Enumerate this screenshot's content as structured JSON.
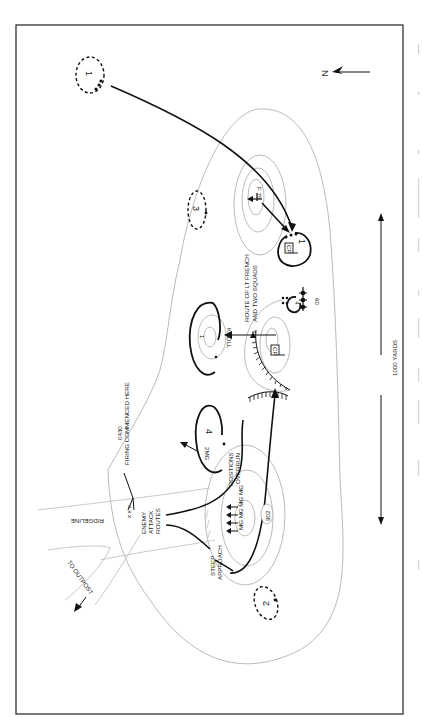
{
  "map": {
    "north_label": "N",
    "scale_label": "1000 YARDS",
    "labels": {
      "route_lt_french_line1": "ROUTE OF LT FRENCH",
      "route_lt_french_line2": "AND TWO SQUADS",
      "knoll": "KNOLL",
      "firing_line1": "0430",
      "firing_line2": "FIRING COMMENCED HERE",
      "positions_line1": "POSITIONS",
      "positions_line2": "OVERRUN",
      "enemy_line1": "ENEMY",
      "enemy_line2": "ATTACK",
      "enemy_line3": "ROUTES",
      "steep_line1": "STEEP",
      "steep_line2": "APPROACH",
      "ridgeline": "RIDGELINE",
      "to_outpost": "TO OUTPOST",
      "mg_label": "2MG",
      "mg_row": "MG MG MG MG",
      "hill": "902",
      "mortar": "60",
      "f75": "F 75"
    },
    "positions": {
      "p1_top": "1",
      "p1_cp": "1",
      "p2": "2",
      "p3": "3",
      "p4": "4",
      "p4_small": "4",
      "knoll": "1"
    },
    "cp_marks": {
      "cp1": "CP",
      "cp2": "CP"
    }
  }
}
